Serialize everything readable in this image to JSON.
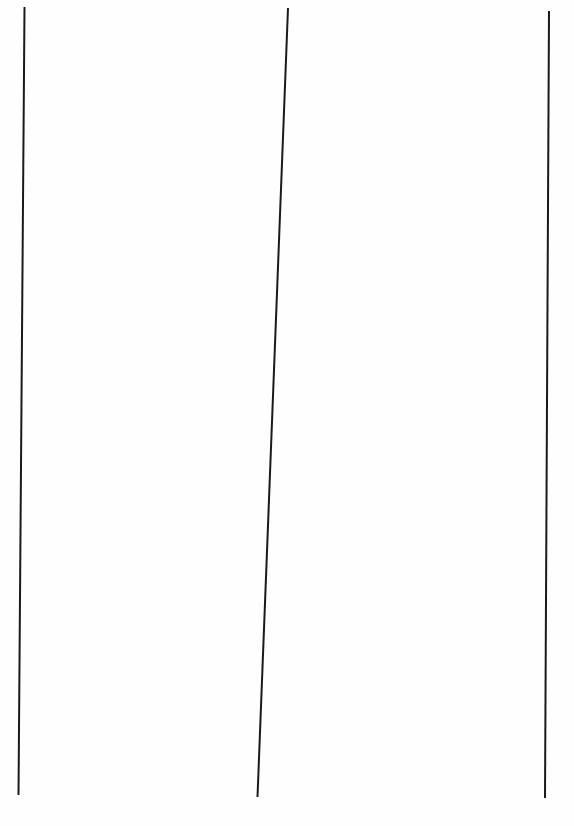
{
  "document": {
    "type": "ruled-page",
    "background_color": "#fefefe",
    "line_color": "#1a1a1a",
    "line_width": 2,
    "vertical_rules": [
      {
        "x1": 24.5,
        "y1": 7,
        "x2": 18.5,
        "y2": 795
      },
      {
        "x1": 288,
        "y1": 8,
        "x2": 257.5,
        "y2": 797
      },
      {
        "x1": 549,
        "y1": 11,
        "x2": 545,
        "y2": 798
      }
    ]
  }
}
